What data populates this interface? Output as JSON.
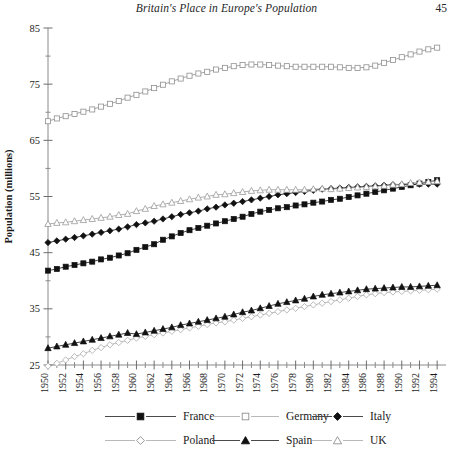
{
  "running_head": {
    "title": "Britain's Place in Europe's Population",
    "page_number": "45"
  },
  "chart_data": {
    "type": "line",
    "title": "",
    "xlabel": "",
    "ylabel": "Population (millions)",
    "xlim": [
      1950,
      1995
    ],
    "ylim": [
      25,
      85
    ],
    "y_ticks": [
      25,
      35,
      45,
      55,
      65,
      75,
      85
    ],
    "y_minor_step": 5,
    "grid": false,
    "legend_position": "bottom",
    "x_tick_labels": [
      "1950",
      "1952",
      "1954",
      "1956",
      "1958",
      "1960",
      "1962",
      "1964",
      "1966",
      "1968",
      "1970",
      "1972",
      "1974",
      "1976",
      "1978",
      "1980",
      "1982",
      "1984",
      "1986",
      "1988",
      "1990",
      "1992",
      "1994"
    ],
    "x": [
      1950,
      1951,
      1952,
      1953,
      1954,
      1955,
      1956,
      1957,
      1958,
      1959,
      1960,
      1961,
      1962,
      1963,
      1964,
      1965,
      1966,
      1967,
      1968,
      1969,
      1970,
      1971,
      1972,
      1973,
      1974,
      1975,
      1976,
      1977,
      1978,
      1979,
      1980,
      1981,
      1982,
      1983,
      1984,
      1985,
      1986,
      1987,
      1988,
      1989,
      1990,
      1991,
      1992,
      1993,
      1994
    ],
    "series": [
      {
        "name": "France",
        "marker": "filled-square",
        "color": "#111111",
        "values": [
          41.8,
          42.1,
          42.5,
          42.8,
          43.1,
          43.4,
          43.8,
          44.1,
          44.5,
          44.9,
          45.5,
          46.0,
          46.5,
          47.3,
          47.9,
          48.5,
          49.0,
          49.4,
          49.8,
          50.2,
          50.6,
          51.0,
          51.4,
          51.9,
          52.3,
          52.6,
          52.9,
          53.1,
          53.4,
          53.6,
          53.9,
          54.1,
          54.4,
          54.6,
          54.9,
          55.2,
          55.5,
          55.8,
          56.1,
          56.4,
          56.7,
          57.0,
          57.3,
          57.6,
          57.9
        ]
      },
      {
        "name": "Germany",
        "marker": "open-square",
        "color": "#8f8f8f",
        "values": [
          68.4,
          68.9,
          69.3,
          69.7,
          70.1,
          70.5,
          71.0,
          71.5,
          72.0,
          72.6,
          73.1,
          73.7,
          74.3,
          74.9,
          75.5,
          76.0,
          76.5,
          76.9,
          77.2,
          77.6,
          77.9,
          78.2,
          78.4,
          78.5,
          78.5,
          78.4,
          78.3,
          78.2,
          78.1,
          78.1,
          78.1,
          78.1,
          78.1,
          78.0,
          77.9,
          77.9,
          78.0,
          78.3,
          78.8,
          79.3,
          79.8,
          80.3,
          80.8,
          81.2,
          81.5
        ]
      },
      {
        "name": "Italy",
        "marker": "filled-diamond",
        "color": "#111111",
        "values": [
          46.8,
          47.1,
          47.4,
          47.7,
          48.0,
          48.3,
          48.6,
          48.9,
          49.2,
          49.6,
          50.0,
          50.3,
          50.6,
          51.0,
          51.4,
          51.8,
          52.1,
          52.4,
          52.8,
          53.1,
          53.5,
          53.8,
          54.1,
          54.4,
          54.7,
          55.0,
          55.3,
          55.5,
          55.7,
          55.9,
          56.1,
          56.3,
          56.4,
          56.5,
          56.6,
          56.7,
          56.8,
          56.9,
          57.0,
          57.1,
          57.1,
          57.2,
          57.2,
          57.2,
          57.2
        ]
      },
      {
        "name": "Poland",
        "marker": "open-diamond",
        "color": "#a8a8a8",
        "values": [
          24.8,
          25.3,
          25.9,
          26.5,
          27.0,
          27.6,
          28.1,
          28.6,
          29.0,
          29.4,
          29.8,
          30.1,
          30.4,
          30.7,
          31.0,
          31.3,
          31.6,
          31.9,
          32.2,
          32.5,
          32.7,
          33.0,
          33.3,
          33.6,
          33.9,
          34.2,
          34.5,
          34.8,
          35.1,
          35.4,
          35.7,
          36.0,
          36.3,
          36.6,
          36.9,
          37.2,
          37.5,
          37.7,
          37.9,
          38.0,
          38.1,
          38.2,
          38.3,
          38.4,
          38.5
        ]
      },
      {
        "name": "Spain",
        "marker": "filled-triangle",
        "color": "#111111",
        "values": [
          28.0,
          28.3,
          28.6,
          28.9,
          29.2,
          29.5,
          29.8,
          30.1,
          30.4,
          30.7,
          30.5,
          30.8,
          31.1,
          31.4,
          31.7,
          32.1,
          32.4,
          32.7,
          33.0,
          33.3,
          33.6,
          34.0,
          34.4,
          34.7,
          35.1,
          35.5,
          35.9,
          36.2,
          36.5,
          36.8,
          37.2,
          37.5,
          37.7,
          37.9,
          38.1,
          38.3,
          38.5,
          38.6,
          38.7,
          38.8,
          38.9,
          38.9,
          39.0,
          39.1,
          39.2
        ]
      },
      {
        "name": "UK",
        "marker": "open-triangle",
        "color": "#9b9b9b",
        "values": [
          50.1,
          50.3,
          50.4,
          50.6,
          50.8,
          51.0,
          51.2,
          51.4,
          51.7,
          51.9,
          52.4,
          52.8,
          53.3,
          53.6,
          53.9,
          54.2,
          54.5,
          54.8,
          55.0,
          55.3,
          55.4,
          55.6,
          55.8,
          56.0,
          56.1,
          56.2,
          56.2,
          56.2,
          56.2,
          56.2,
          56.3,
          56.4,
          56.3,
          56.4,
          56.5,
          56.6,
          56.7,
          56.8,
          56.9,
          57.1,
          57.2,
          57.4,
          57.5,
          57.6,
          57.7
        ]
      }
    ]
  },
  "legend": {
    "items": [
      {
        "label": "France",
        "marker": "filled-square"
      },
      {
        "label": "Germany",
        "marker": "open-square"
      },
      {
        "label": "Italy",
        "marker": "filled-diamond"
      },
      {
        "label": "Poland",
        "marker": "open-diamond"
      },
      {
        "label": "Spain",
        "marker": "filled-triangle"
      },
      {
        "label": "UK",
        "marker": "open-triangle"
      }
    ]
  }
}
